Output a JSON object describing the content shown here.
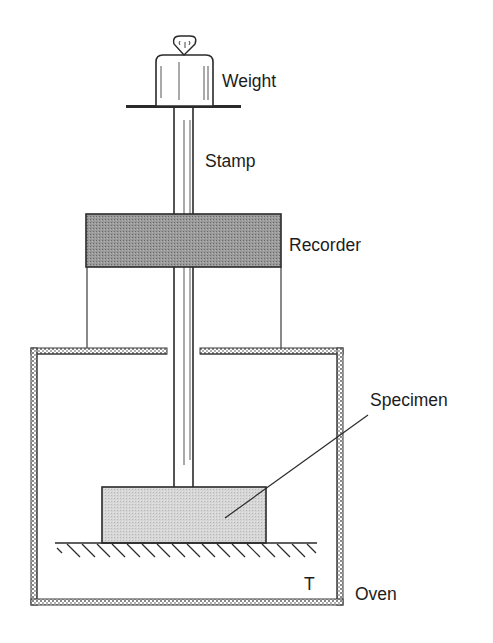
{
  "diagram": {
    "type": "creep-test-apparatus",
    "labels": {
      "weight": "Weight",
      "stamp": "Stamp",
      "recorder": "Recorder",
      "specimen": "Specimen",
      "temperature": "T",
      "oven": "Oven"
    },
    "colors": {
      "line": "#2a2a2a",
      "recorder_fill": "#8a8a8a",
      "specimen_fill": "#cfcfcf",
      "oven_wall": "#9a9a9a",
      "background": "#ffffff"
    }
  }
}
